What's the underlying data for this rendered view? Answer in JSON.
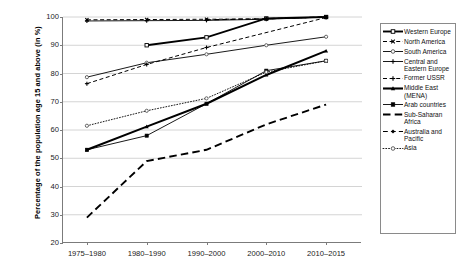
{
  "chart_data": {
    "type": "line",
    "title": "",
    "xlabel": "",
    "ylabel": "Percentage of the population age 15 and above (in %)",
    "categories": [
      "1975–1980",
      "1980–1990",
      "1990–2000",
      "2000–2010",
      "2010–2015"
    ],
    "ylim": [
      20,
      100
    ],
    "yticks": [
      20,
      30,
      40,
      50,
      60,
      70,
      80,
      90,
      100
    ],
    "grid": true,
    "legend_position": "right",
    "series": [
      {
        "name": "Western Europe",
        "marker": "open-square",
        "line": "solid",
        "width": 1.9,
        "values": [
          null,
          90.0,
          92.8,
          99.5,
          100.0
        ]
      },
      {
        "name": "North America",
        "marker": "cross",
        "line": "dashed",
        "width": 1.0,
        "values": [
          99.0,
          99.1,
          99.2,
          99.3,
          100.0
        ]
      },
      {
        "name": "South America",
        "marker": "open-circle",
        "line": "solid",
        "width": 0.9,
        "values": [
          78.7,
          83.8,
          86.8,
          90.0,
          93.0
        ]
      },
      {
        "name": "Central and Eastern Europe",
        "marker": "plus",
        "line": "solid",
        "width": 0.9,
        "values": [
          98.6,
          98.7,
          98.8,
          99.2,
          100.0
        ]
      },
      {
        "name": "Former USSR",
        "marker": "plus",
        "line": "dashed",
        "width": 1.0,
        "values": [
          76.4,
          83.2,
          89.2,
          null,
          99.8
        ]
      },
      {
        "name": "Middle East (MENA)",
        "marker": "filled-triangle",
        "line": "solid",
        "width": 2.1,
        "values": [
          53.0,
          61.2,
          69.3,
          79.5,
          88.0
        ]
      },
      {
        "name": "Arab countries",
        "marker": "filled-square",
        "line": "solid",
        "width": 0.9,
        "values": [
          53.0,
          58.0,
          69.3,
          81.0,
          84.5
        ]
      },
      {
        "name": "Sub-Saharan Africa",
        "marker": "none",
        "line": "long-dash",
        "width": 1.9,
        "values": [
          29.0,
          49.0,
          53.0,
          62.0,
          69.0
        ]
      },
      {
        "name": "Australia and Pacific",
        "marker": "filled-diamond",
        "line": "dashed",
        "width": 1.2,
        "values": [
          null,
          null,
          99.0,
          99.4,
          100.0
        ]
      },
      {
        "name": "Asia",
        "marker": "open-circle",
        "line": "dotted",
        "width": 0.9,
        "values": [
          61.5,
          66.8,
          71.2,
          80.5,
          84.5
        ]
      }
    ]
  }
}
